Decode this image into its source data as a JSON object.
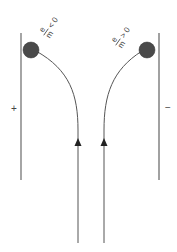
{
  "diagram": {
    "left_plate": {
      "sign": "+"
    },
    "right_plate": {
      "sign": "−"
    },
    "left_particle": {
      "label_num": "e",
      "label_den": "m",
      "label_rel": "< 0"
    },
    "right_particle": {
      "label_num": "e",
      "label_den": "m",
      "label_rel": "> 0"
    },
    "colors": {
      "line": "#555555",
      "plate": "#777777",
      "ball": "#4a4a4a",
      "text": "#444444"
    }
  }
}
